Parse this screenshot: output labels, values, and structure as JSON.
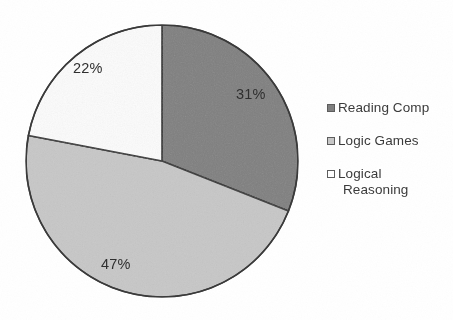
{
  "chart_data": {
    "type": "pie",
    "title": "",
    "subtitle": "",
    "xlabel": "",
    "ylabel": "",
    "grid": false,
    "legend_position": "right",
    "categories": [
      "Reading Comp",
      "Logic Games",
      "Logical Reasoning"
    ],
    "values": [
      31,
      47,
      22
    ],
    "unit": "%",
    "data_labels": [
      "31%",
      "47%",
      "22%"
    ],
    "start_angle_deg": 0,
    "direction": "clockwise",
    "slice_colors": [
      "#808080",
      "#c8c8c8",
      "#fcfcfc"
    ],
    "slice_outline_color": "#333333",
    "slices": [
      {
        "name": "Reading Comp",
        "value": 31,
        "label": "31%",
        "color": "#808080",
        "start_deg": 0,
        "end_deg": 111.6
      },
      {
        "name": "Logic Games",
        "value": 47,
        "label": "47%",
        "color": "#c8c8c8",
        "start_deg": 111.6,
        "end_deg": 280.8
      },
      {
        "name": "Logical Reasoning",
        "value": 22,
        "label": "22%",
        "color": "#fcfcfc",
        "start_deg": 280.8,
        "end_deg": 360
      }
    ]
  },
  "labels": {
    "reading_comp_pct": "31%",
    "logic_games_pct": "47%",
    "logical_reasoning_pct": "22%"
  },
  "legend": {
    "items": [
      {
        "label": "Reading Comp",
        "label_line2": "",
        "color": "#808080"
      },
      {
        "label": "Logic Games",
        "label_line2": "",
        "color": "#c8c8c8"
      },
      {
        "label": "Logical",
        "label_line2": "Reasoning",
        "color": "#ffffff"
      }
    ]
  },
  "colors": {
    "slice_dark": "#808080",
    "slice_light": "#c8c8c8",
    "slice_white": "#fcfcfc",
    "outline": "#333333",
    "text": "#3b3b3b",
    "background": "#ffffff"
  }
}
